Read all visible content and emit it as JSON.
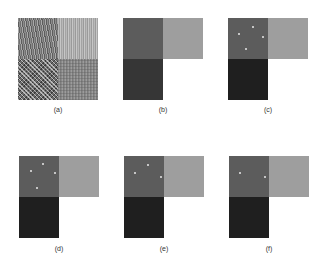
{
  "figure": {
    "panels": [
      {
        "id": "a",
        "label": "(a)",
        "content": "textured mosaic input (4 texture regions)"
      },
      {
        "id": "b",
        "label": "(b)",
        "content": "ground-truth segmentation (3 gray regions + white)"
      },
      {
        "id": "c",
        "label": "(c)",
        "content": "segmentation result"
      },
      {
        "id": "d",
        "label": "(d)",
        "content": "segmentation result"
      },
      {
        "id": "e",
        "label": "(e)",
        "content": "segmentation result"
      },
      {
        "id": "f",
        "label": "(f)",
        "content": "segmentation result"
      }
    ],
    "colors": {
      "region_top_left": "#5c5c5c",
      "region_top_right": "#9e9e9e",
      "region_bottom_left": "#262626",
      "region_bottom_right": "#ffffff"
    }
  }
}
